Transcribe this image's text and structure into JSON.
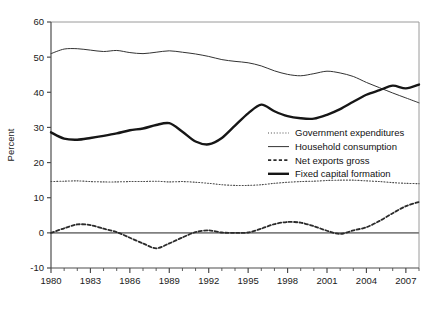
{
  "chart_data": {
    "type": "line",
    "title": "",
    "xlabel": "",
    "ylabel": "Percent",
    "xlim": [
      1980,
      2008
    ],
    "ylim": [
      -10,
      60
    ],
    "ytick_labels": [
      "60",
      "50",
      "40",
      "30",
      "20",
      "10",
      "0",
      "-10"
    ],
    "ytick_values": [
      60,
      50,
      40,
      30,
      20,
      10,
      0,
      -10
    ],
    "xtick_labels": [
      "1980",
      "1983",
      "1986",
      "1989",
      "1992",
      "1995",
      "1998",
      "2001",
      "2004",
      "2007"
    ],
    "xtick_values": [
      1980,
      1983,
      1986,
      1989,
      1992,
      1995,
      1998,
      2001,
      2004,
      2007
    ],
    "grid": false,
    "zero_reference_line": true,
    "legend_position": "center-right",
    "x": [
      1980,
      1981,
      1982,
      1983,
      1984,
      1985,
      1986,
      1987,
      1988,
      1989,
      1990,
      1991,
      1992,
      1993,
      1994,
      1995,
      1996,
      1997,
      1998,
      1999,
      2000,
      2001,
      2002,
      2003,
      2004,
      2005,
      2006,
      2007,
      2008
    ],
    "series": [
      {
        "name": "Government expenditures",
        "style": "dotted",
        "color": "#4d4d4d",
        "width": 1.1,
        "values": [
          14.6,
          14.7,
          14.8,
          14.6,
          14.5,
          14.5,
          14.6,
          14.6,
          14.7,
          14.5,
          14.6,
          14.4,
          14.1,
          13.7,
          13.5,
          13.5,
          13.7,
          14.1,
          14.4,
          14.6,
          14.7,
          14.9,
          15.0,
          15.0,
          14.8,
          14.6,
          14.3,
          14.1,
          14.0
        ]
      },
      {
        "name": "Household consumption",
        "style": "solid-thin",
        "color": "#333333",
        "width": 1.0,
        "values": [
          51.0,
          52.3,
          52.4,
          52.0,
          51.6,
          51.9,
          51.3,
          51.0,
          51.4,
          51.8,
          51.4,
          50.9,
          50.2,
          49.3,
          48.8,
          48.4,
          47.5,
          46.1,
          45.1,
          44.7,
          45.3,
          46.0,
          45.5,
          44.5,
          42.8,
          41.3,
          39.8,
          38.4,
          37.0
        ]
      },
      {
        "name": "Net exports gross",
        "style": "dashed",
        "color": "#2b2b2b",
        "width": 1.8,
        "values": [
          0.0,
          1.3,
          2.4,
          2.2,
          1.2,
          0.2,
          -1.4,
          -3.0,
          -4.4,
          -3.0,
          -1.3,
          0.2,
          0.7,
          0.1,
          0.0,
          0.1,
          1.2,
          2.5,
          3.1,
          2.9,
          1.9,
          0.6,
          -0.3,
          0.7,
          1.6,
          3.4,
          5.6,
          7.6,
          8.8
        ]
      },
      {
        "name": "Fixed capital formation",
        "style": "solid-thick",
        "color": "#161616",
        "width": 2.4,
        "values": [
          28.6,
          26.8,
          26.5,
          27.0,
          27.6,
          28.3,
          29.2,
          29.7,
          30.7,
          31.2,
          28.8,
          26.0,
          25.2,
          27.0,
          30.5,
          34.0,
          36.5,
          34.6,
          33.2,
          32.6,
          32.5,
          33.6,
          35.2,
          37.3,
          39.3,
          40.6,
          41.9,
          41.1,
          42.2
        ]
      }
    ]
  },
  "legend": {
    "items": [
      {
        "label": "Government expenditures",
        "marker": "dotted-line-marker"
      },
      {
        "label": "Household consumption",
        "marker": "solid-thin-line-marker"
      },
      {
        "label": "Net exports gross",
        "marker": "dashed-line-marker"
      },
      {
        "label": "Fixed capital formation",
        "marker": "solid-thick-line-marker"
      }
    ]
  },
  "colors": {
    "axis": "#6b6b6b",
    "frame": "#9a9a9a",
    "zero_line": "#808080",
    "text": "#1a1a1a"
  }
}
